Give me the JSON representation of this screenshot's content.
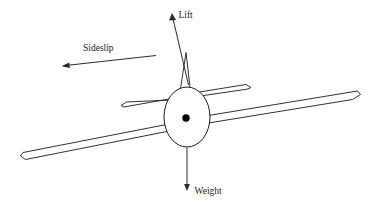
{
  "figure": {
    "background_color": "#ffffff",
    "line_color": "#1b1b1b",
    "width": 370,
    "height": 209
  },
  "labels": {
    "lift": "Lift",
    "sideslip": "Sideslip",
    "weight": "Weight"
  },
  "vectors": [
    {
      "name": "lift",
      "label": "Lift",
      "direction": "up-left",
      "from": [
        188,
        84
      ],
      "to": [
        172,
        14
      ],
      "label_x": 178,
      "label_y": 16
    },
    {
      "name": "sideslip",
      "label": "Sideslip",
      "direction": "left",
      "from": [
        156,
        55
      ],
      "to": [
        62,
        66
      ],
      "label_x": 83,
      "label_y": 50
    },
    {
      "name": "weight",
      "label": "Weight",
      "direction": "down",
      "from": [
        187,
        148
      ],
      "to": [
        187,
        190
      ],
      "label_x": 194,
      "label_y": 194
    }
  ],
  "aircraft": {
    "fuselage": {
      "name": "fuselage-ellipse",
      "cx": 187,
      "cy": 117,
      "rx": 23,
      "ry": 30
    },
    "center_of_gravity": {
      "name": "center-of-gravity-dot",
      "cx": 186,
      "cy": 118,
      "r": 3.6
    },
    "left_wing": {
      "name": "left-wing",
      "tip": [
        22,
        157
      ],
      "root": [
        180,
        125
      ]
    },
    "right_wing": {
      "name": "right-wing",
      "tip": [
        359,
        95
      ],
      "root": [
        196,
        124
      ]
    },
    "left_stabilizer": {
      "name": "left-horizontal-stabilizer",
      "tip": [
        122,
        106
      ],
      "root": [
        172,
        96
      ]
    },
    "right_stabilizer": {
      "name": "right-horizontal-stabilizer",
      "tip": [
        250,
        88
      ],
      "root": [
        200,
        97
      ]
    },
    "vertical_fin": {
      "name": "vertical-fin",
      "apex": [
        186,
        53
      ],
      "base_left": [
        180,
        93
      ],
      "base_right": [
        190,
        92
      ]
    }
  }
}
